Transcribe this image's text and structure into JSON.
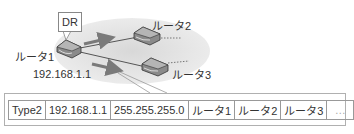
{
  "diagram": {
    "dr_label": "DR",
    "routers": [
      {
        "id": "router1",
        "label": "ルータ1",
        "ip": "192.168.1.1",
        "role": "DR"
      },
      {
        "id": "router2",
        "label": "ルータ2"
      },
      {
        "id": "router3",
        "label": "ルータ3"
      }
    ],
    "colors": {
      "segment_fill": "#e4e4e4",
      "arrow": "#7a7a7a",
      "link": "#555555",
      "router_body": "#8a8a8a"
    }
  },
  "lsa_table": {
    "cells": [
      "Type2",
      "192.168.1.1",
      "255.255.255.0",
      "ルータ1",
      "ルータ2",
      "ルータ3",
      "…"
    ]
  }
}
